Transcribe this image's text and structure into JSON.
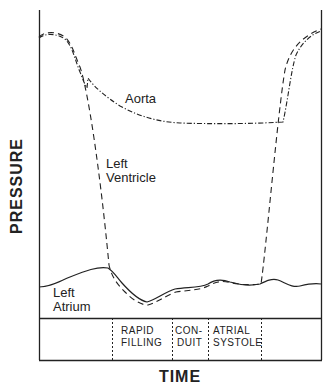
{
  "diagram": {
    "title": "",
    "axes": {
      "x_label": "TIME",
      "y_label": "PRESSURE"
    },
    "curves": [
      {
        "id": "aorta",
        "label": "Aorta",
        "style": "dash-dot"
      },
      {
        "id": "left-ventricle",
        "label_line1": "Left",
        "label_line2": "Ventricle",
        "style": "dashed"
      },
      {
        "id": "left-atrium",
        "label_line1": "Left",
        "label_line2": "Atrium",
        "style": "solid"
      }
    ],
    "phases": [
      {
        "line1": "RAPID",
        "line2": "FILLING"
      },
      {
        "line1": "CON-",
        "line2": "DUIT"
      },
      {
        "line1": "ATRIAL",
        "line2": "SYSTOLE"
      }
    ],
    "colors": {
      "ink": "#222222",
      "background": "#ffffff"
    }
  }
}
